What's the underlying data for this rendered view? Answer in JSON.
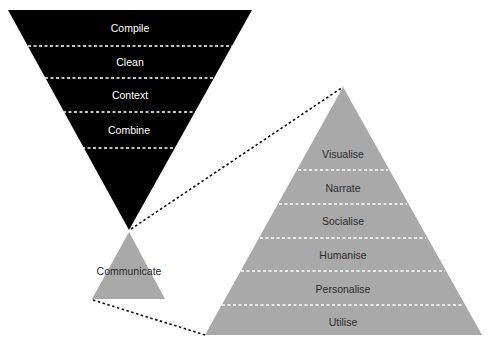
{
  "colors": {
    "funnel_fill": "#000000",
    "pyramid_fill": "#a9a9a9",
    "divider_on_dark": "#ffffff",
    "divider_on_gray": "#ffffff",
    "connector": "#111111",
    "text_on_dark": "#ffffff",
    "text_on_gray": "#2b2b2b"
  },
  "funnel": {
    "stages": [
      {
        "label": "Compile"
      },
      {
        "label": "Clean"
      },
      {
        "label": "Context"
      },
      {
        "label": "Combine"
      }
    ]
  },
  "hub": {
    "label": "Communicate"
  },
  "pyramid": {
    "stages": [
      {
        "label": "Visualise"
      },
      {
        "label": "Narrate"
      },
      {
        "label": "Socialise"
      },
      {
        "label": "Humanise"
      },
      {
        "label": "Personalise"
      },
      {
        "label": "Utilise"
      }
    ]
  }
}
